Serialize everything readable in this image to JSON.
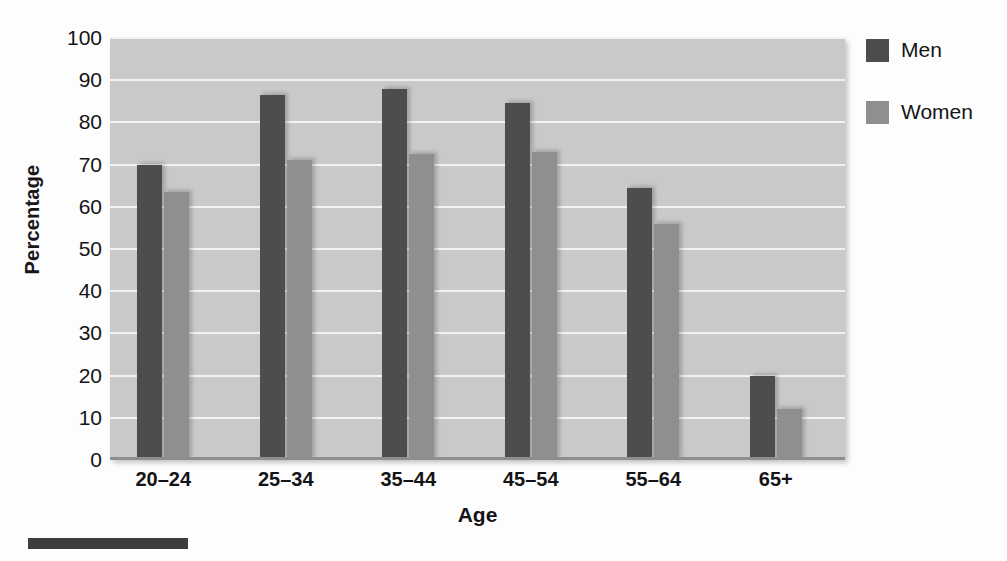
{
  "chart_data": {
    "type": "bar",
    "title": "",
    "xlabel": "Age",
    "ylabel": "Percentage",
    "categories": [
      "20–24",
      "25–34",
      "35–44",
      "45–54",
      "55–64",
      "65+"
    ],
    "series": [
      {
        "name": "Men",
        "color": "#4d4d4d",
        "values": [
          70,
          86.5,
          88,
          84.5,
          64.5,
          20
        ]
      },
      {
        "name": "Women",
        "color": "#8f8f8f",
        "values": [
          63.5,
          71,
          72.5,
          73,
          56,
          12
        ]
      }
    ],
    "ylim": [
      0,
      100
    ],
    "yticks": [
      0,
      10,
      20,
      30,
      40,
      50,
      60,
      70,
      80,
      90,
      100
    ],
    "ytick_labels": [
      "0",
      "10",
      "20",
      "30",
      "40",
      "50",
      "60",
      "70",
      "80",
      "90",
      "100"
    ],
    "grid": true,
    "grid_axis": "y",
    "legend_position": "right-top",
    "plot_background": "#c9c9c9",
    "gridline_color": "#f2f2f2"
  },
  "axes": {
    "y_title": "Percentage",
    "x_title": "Age"
  },
  "legend": {
    "entries": [
      {
        "label": "Men",
        "color": "#4d4d4d"
      },
      {
        "label": "Women",
        "color": "#8f8f8f"
      }
    ]
  }
}
